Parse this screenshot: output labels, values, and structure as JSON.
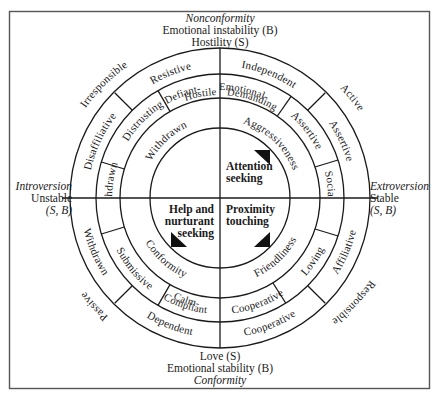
{
  "diagram": {
    "type": "circumplex",
    "axes": {
      "top": {
        "line1": "Nonconformity",
        "line2": "Emotional instability (B)",
        "line3": "Hostility (S)"
      },
      "bottom": {
        "line1": "Love (S)",
        "line2": "Emotional stability (B)",
        "line3": "Conformity"
      },
      "left": {
        "line1": "Introversion",
        "line2": "Unstable",
        "line3": "(S, B)"
      },
      "right": {
        "line1": "Extroversion",
        "line2": "Stable",
        "line3": "(S, B)"
      }
    },
    "outer_labels": [
      "Irresponsible",
      "Active",
      "Responsible",
      "Passive"
    ],
    "ring3": [
      "Resistive",
      "Independent",
      "Assertive",
      "Affiliative",
      "Cooperative",
      "Dependent",
      "Withdrawn",
      "Disaffiliative"
    ],
    "ring2": [
      "Defiant-",
      "Hostile",
      "Emotional-",
      "Demanding",
      "Assertive",
      "Sociable",
      "Loving",
      "Cooperative",
      "Calm-",
      "Compliant",
      "Submissive",
      "Withdrawn",
      "Distrusting"
    ],
    "ring1": [
      "Aggressiveness",
      "Friendliness",
      "Conformity",
      "Withdrawn"
    ],
    "center": {
      "q1": {
        "line1": "Attention",
        "line2": "seeking"
      },
      "q3": {
        "line1": "Proximity",
        "line2": "touching"
      },
      "q4": {
        "line1": "Help and",
        "line2": "nurturant",
        "line3": "seeking"
      }
    }
  }
}
